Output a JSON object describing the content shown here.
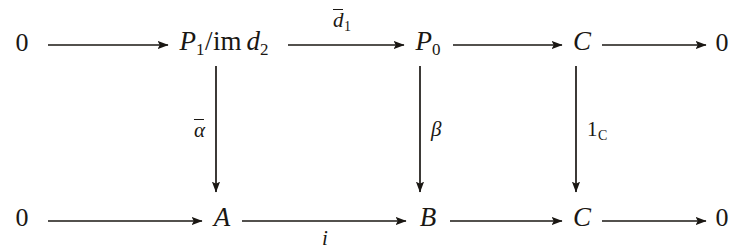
{
  "diagram": {
    "kind": "commutative-ladder-diagram",
    "ink_color": "#1a1713",
    "background_color": "#ffffff",
    "rows": [
      {
        "id": "top-row",
        "nodes": [
          {
            "id": "top-zero-left",
            "label": "0",
            "x": 22,
            "y": 30
          },
          {
            "id": "top-quotient",
            "label": "P1/im d2",
            "x": 224,
            "y": 28
          },
          {
            "id": "top-p0",
            "label": "P0",
            "x": 428,
            "y": 28
          },
          {
            "id": "top-c",
            "label": "C",
            "x": 582,
            "y": 28
          },
          {
            "id": "top-zero-right",
            "label": "0",
            "x": 722,
            "y": 30
          }
        ],
        "arrows": [
          {
            "id": "top-arrow-1",
            "from": "top-zero-left",
            "to": "top-quotient",
            "label": ""
          },
          {
            "id": "top-arrow-2",
            "from": "top-quotient",
            "to": "top-p0",
            "label": "d1bar",
            "label_position": "above"
          },
          {
            "id": "top-arrow-3",
            "from": "top-p0",
            "to": "top-c",
            "label": ""
          },
          {
            "id": "top-arrow-4",
            "from": "top-c",
            "to": "top-zero-right",
            "label": ""
          }
        ]
      },
      {
        "id": "bottom-row",
        "nodes": [
          {
            "id": "bottom-zero-left",
            "label": "0",
            "x": 22,
            "y": 205
          },
          {
            "id": "bottom-a",
            "label": "A",
            "x": 222,
            "y": 204
          },
          {
            "id": "bottom-b",
            "label": "B",
            "x": 428,
            "y": 204
          },
          {
            "id": "bottom-c",
            "label": "C",
            "x": 582,
            "y": 204
          },
          {
            "id": "bottom-zero-right",
            "label": "0",
            "x": 722,
            "y": 205
          }
        ],
        "arrows": [
          {
            "id": "bottom-arrow-1",
            "from": "bottom-zero-left",
            "to": "bottom-a",
            "label": ""
          },
          {
            "id": "bottom-arrow-2",
            "from": "bottom-a",
            "to": "bottom-b",
            "label": "i",
            "label_position": "below"
          },
          {
            "id": "bottom-arrow-3",
            "from": "bottom-b",
            "to": "bottom-c",
            "label": ""
          },
          {
            "id": "bottom-arrow-4",
            "from": "bottom-c",
            "to": "bottom-zero-right",
            "label": ""
          }
        ]
      }
    ],
    "vertical_arrows": [
      {
        "id": "vertical-alpha",
        "from": "top-quotient",
        "to": "bottom-a",
        "label": "alphabar",
        "label_side": "left",
        "x": 216
      },
      {
        "id": "vertical-beta",
        "from": "top-p0",
        "to": "bottom-b",
        "label": "beta",
        "label_side": "right",
        "x": 420
      },
      {
        "id": "vertical-identity",
        "from": "top-c",
        "to": "bottom-c",
        "label": "1C",
        "label_side": "right",
        "x": 576
      }
    ],
    "labels": {
      "zero": "0",
      "p_letter": "P",
      "p1_sub": "1",
      "p0_sub": "0",
      "im": "im",
      "slash": "/",
      "d_letter": "d",
      "d2_sub": "2",
      "d1_sub": "1",
      "c_object": "C",
      "a_object": "A",
      "b_object": "B",
      "alpha": "α",
      "beta": "β",
      "identity_one": "1",
      "identity_sub": "C",
      "inclusion": "i"
    }
  }
}
